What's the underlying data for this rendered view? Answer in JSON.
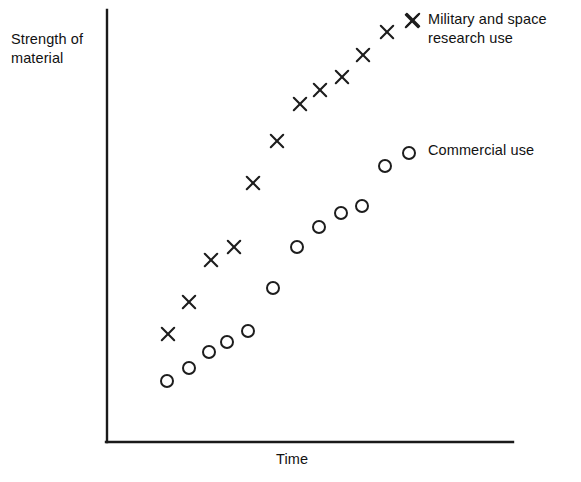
{
  "chart_data": {
    "type": "scatter",
    "title": "",
    "xlabel": "Time",
    "ylabel": "Strength of\nmaterial",
    "grid": false,
    "axes": {
      "x_axis_has_ticks": false,
      "y_axis_has_ticks": false,
      "x_origin_px": 107,
      "y_origin_px": 442,
      "x_end_px": 513,
      "y_top_px": 10
    },
    "legend": {
      "position": "right",
      "entries": [
        {
          "label": "Military and space\nresearch use",
          "marker": "x"
        },
        {
          "label": "Commercial use",
          "marker": "o"
        }
      ]
    },
    "series": [
      {
        "name": "Military and space research use",
        "marker": "x",
        "color": "#1d1d1d",
        "points_px": [
          [
            168,
            334
          ],
          [
            189,
            302
          ],
          [
            211,
            260
          ],
          [
            234,
            247
          ],
          [
            253,
            183
          ],
          [
            277,
            141
          ],
          [
            300,
            104
          ],
          [
            320,
            90
          ],
          [
            342,
            77
          ],
          [
            363,
            55
          ],
          [
            387,
            32
          ],
          [
            412,
            21
          ]
        ],
        "x": [
          0.15,
          0.2,
          0.26,
          0.31,
          0.36,
          0.42,
          0.48,
          0.52,
          0.58,
          0.63,
          0.69,
          0.75
        ],
        "y": [
          0.25,
          0.32,
          0.42,
          0.45,
          0.6,
          0.7,
          0.78,
          0.81,
          0.84,
          0.9,
          0.95,
          0.97
        ]
      },
      {
        "name": "Commercial use",
        "marker": "o",
        "color": "#1d1d1d",
        "points_px": [
          [
            167,
            381
          ],
          [
            189,
            368
          ],
          [
            209,
            352
          ],
          [
            227,
            342
          ],
          [
            248,
            331
          ],
          [
            273,
            288
          ],
          [
            297,
            247
          ],
          [
            319,
            227
          ],
          [
            341,
            213
          ],
          [
            362,
            206
          ],
          [
            385,
            166
          ],
          [
            409,
            153
          ]
        ],
        "x": [
          0.15,
          0.2,
          0.25,
          0.3,
          0.35,
          0.41,
          0.47,
          0.52,
          0.58,
          0.63,
          0.69,
          0.74
        ],
        "y": [
          0.14,
          0.17,
          0.21,
          0.23,
          0.26,
          0.36,
          0.45,
          0.5,
          0.53,
          0.55,
          0.64,
          0.67
        ]
      }
    ]
  },
  "labels": {
    "y_axis": "Strength of\nmaterial",
    "x_axis": "Time",
    "legend_military": "Military and space\nresearch use",
    "legend_commercial": "Commercial use"
  },
  "colors": {
    "ink": "#1d1d1d",
    "axis": "#1a1a1a",
    "background": "#ffffff"
  }
}
